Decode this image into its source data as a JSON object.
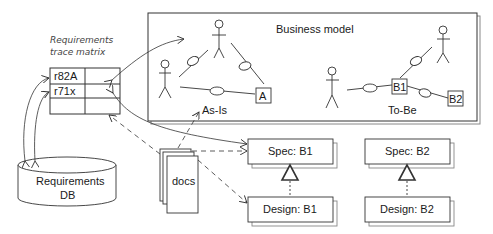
{
  "diagram": {
    "matrix": {
      "title_line1": "Requirements",
      "title_line2": "trace matrix",
      "rows": [
        "r82A",
        "r71x",
        ""
      ]
    },
    "database": {
      "line1": "Requirements",
      "line2": "DB"
    },
    "business_model": {
      "title": "Business model",
      "as_is_label": "As-Is",
      "to_be_label": "To-Be",
      "as_is_box": "A",
      "to_be_boxes": [
        "B1",
        "B2"
      ]
    },
    "docs": {
      "label": "docs"
    },
    "specs": [
      {
        "label": "Spec: B1"
      },
      {
        "label": "Spec: B2"
      }
    ],
    "designs": [
      {
        "label": "Design: B1"
      },
      {
        "label": "Design: B2"
      }
    ]
  },
  "colors": {
    "line": "#333333",
    "shadow": "#888888",
    "background": "#ffffff"
  }
}
